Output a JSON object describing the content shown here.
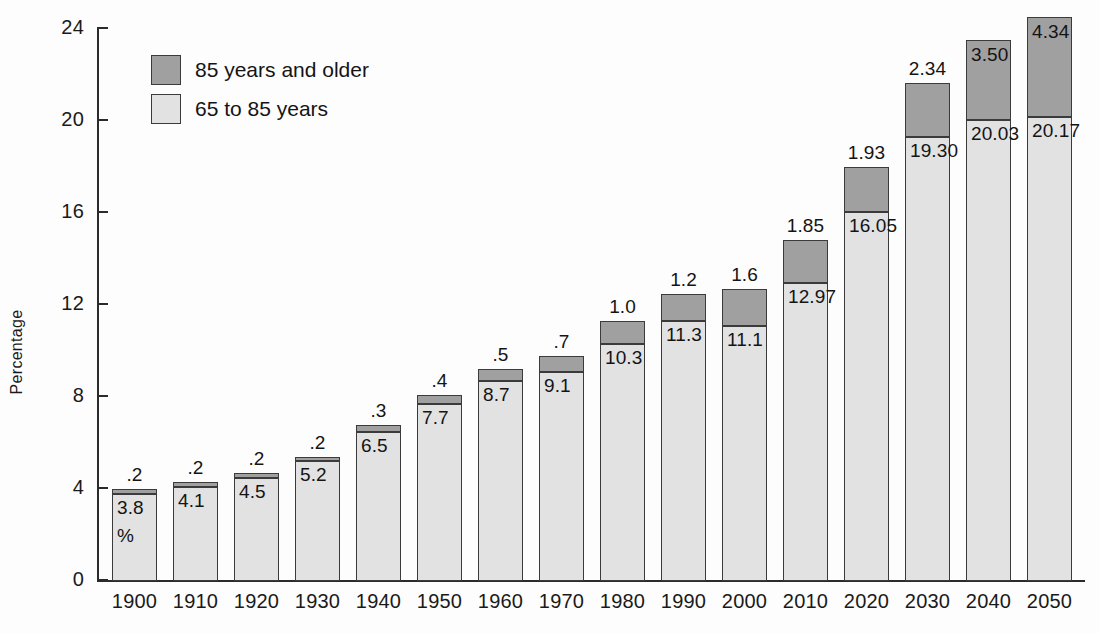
{
  "chart_data": {
    "type": "bar",
    "subtype": "stacked-vertical",
    "title": "",
    "xlabel": "",
    "ylabel": "Percentage",
    "ylim": [
      0,
      24
    ],
    "yticks": [
      0,
      4,
      8,
      12,
      16,
      20,
      24
    ],
    "grid": false,
    "legend_position": "upper-left-inside",
    "categories": [
      "1900",
      "1910",
      "1920",
      "1930",
      "1940",
      "1950",
      "1960",
      "1970",
      "1980",
      "1990",
      "2000",
      "2010",
      "2020",
      "2030",
      "2040",
      "2050"
    ],
    "series": [
      {
        "name": "65 to 85 years",
        "color": "#e2e2e2",
        "values": [
          3.8,
          4.1,
          4.5,
          5.2,
          6.5,
          7.7,
          8.7,
          9.1,
          10.3,
          11.3,
          11.1,
          12.97,
          16.05,
          19.3,
          20.03,
          20.17
        ],
        "labels": [
          "3.8",
          "4.1",
          "4.5",
          "5.2",
          "6.5",
          "7.7",
          "8.7",
          "9.1",
          "10.3",
          "11.3",
          "11.1",
          "12.97",
          "16.05",
          "19.30",
          "20.03",
          "20.17"
        ]
      },
      {
        "name": "85 years and older",
        "color": "#a0a0a0",
        "values": [
          0.2,
          0.2,
          0.2,
          0.2,
          0.3,
          0.4,
          0.5,
          0.7,
          1.0,
          1.2,
          1.6,
          1.85,
          1.93,
          2.34,
          3.5,
          4.34
        ],
        "labels": [
          ".2",
          ".2",
          ".2",
          ".2",
          ".3",
          ".4",
          ".5",
          ".7",
          "1.0",
          "1.2",
          "1.6",
          "1.85",
          "1.93",
          "2.34",
          "3.50",
          "4.34"
        ],
        "label_placement": [
          "above",
          "above",
          "above",
          "above",
          "above",
          "above",
          "above",
          "above",
          "above",
          "above",
          "above",
          "above",
          "above",
          "above",
          "inside",
          "inside"
        ]
      }
    ],
    "annotations": [
      {
        "text": "%",
        "attached_to_category": "1900",
        "note": "percent sign below the 3.8 value inside the first bar"
      }
    ]
  },
  "legend": {
    "items": [
      {
        "label": "85 years and older",
        "color": "#a0a0a0"
      },
      {
        "label": "65 to 85 years",
        "color": "#e2e2e2"
      }
    ]
  },
  "axes": {
    "y": {
      "title": "Percentage",
      "ticks": [
        "24",
        "20",
        "16",
        "12",
        "8",
        "4",
        "0"
      ]
    }
  }
}
